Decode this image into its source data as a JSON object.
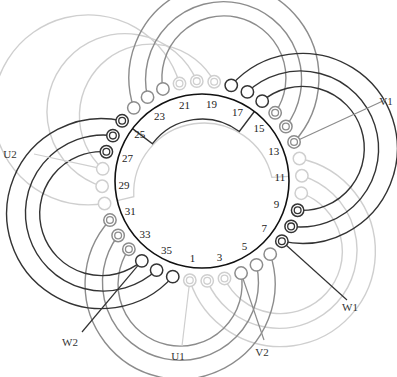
{
  "diagram": {
    "center": [
      202,
      181
    ],
    "stator_radius": 87,
    "label_radius": 78,
    "terminal_radius": 100,
    "slot_count": 36,
    "slot1_angle_deg": 97,
    "slot_step_deg": -10,
    "colors": {
      "dark": "#333333",
      "mid": "#8c8c8c",
      "light": "#cfcfcf",
      "stator": "#111111"
    },
    "slot_labels": [
      "1",
      "3",
      "5",
      "7",
      "9",
      "11",
      "13",
      "15",
      "17",
      "19",
      "21",
      "23",
      "25",
      "27",
      "29",
      "31",
      "33",
      "35"
    ],
    "groups": [
      {
        "name": "w-group-right",
        "color": "dark",
        "pairs": [
          [
            18,
            7
          ],
          [
            17,
            8
          ],
          [
            16,
            9
          ]
        ],
        "ring_a": "plain",
        "ring_b": "double",
        "radii": [
          95,
          78,
          62
        ]
      },
      {
        "name": "w-group-left",
        "color": "dark",
        "pairs": [
          [
            25,
            36
          ],
          [
            26,
            35
          ],
          [
            27,
            34
          ]
        ],
        "ring_a": "double",
        "ring_b": "plain",
        "radii": [
          95,
          78,
          62
        ]
      },
      {
        "name": "v-group-top",
        "color": "mid",
        "pairs": [
          [
            24,
            13
          ],
          [
            23,
            14
          ],
          [
            22,
            15
          ]
        ],
        "ring_a": "plain",
        "ring_b": "double",
        "radii": [
          95,
          78,
          62
        ]
      },
      {
        "name": "v-group-bottom",
        "color": "mid",
        "pairs": [
          [
            31,
            6
          ],
          [
            32,
            5
          ],
          [
            33,
            4
          ]
        ],
        "ring_a": "double",
        "ring_b": "plain",
        "radii": [
          95,
          78,
          62
        ]
      },
      {
        "name": "u-group-topleft",
        "color": "light",
        "pairs": [
          [
            21,
            30
          ],
          [
            20,
            29
          ],
          [
            19,
            28
          ]
        ],
        "ring_a": "double",
        "ring_b": "plain",
        "radii": [
          95,
          78,
          62
        ]
      },
      {
        "name": "u-group-bottomright",
        "color": "light",
        "pairs": [
          [
            1,
            12
          ],
          [
            2,
            11
          ],
          [
            3,
            10
          ]
        ],
        "ring_a": "double",
        "ring_b": "plain",
        "radii": [
          95,
          78,
          62
        ]
      }
    ],
    "leads": [
      {
        "label": "U1",
        "slot": 1,
        "color": "light",
        "text_pos": [
          178,
          360
        ],
        "line_end": [
          182,
          346
        ]
      },
      {
        "label": "V1",
        "slot": 13,
        "color": "mid",
        "text_pos": [
          386,
          105
        ],
        "line_end": [
          385,
          100
        ]
      },
      {
        "label": "W1",
        "slot": 7,
        "color": "dark",
        "text_pos": [
          350,
          311
        ],
        "line_end": [
          347,
          300
        ]
      },
      {
        "label": "U2",
        "slot": 28,
        "color": "light",
        "text_pos": [
          10,
          158
        ],
        "line_end": [
          34,
          154
        ]
      },
      {
        "label": "V2",
        "slot": 4,
        "color": "mid",
        "text_pos": [
          262,
          356
        ],
        "line_end": [
          264,
          340
        ]
      },
      {
        "label": "W2",
        "slot": 34,
        "color": "dark",
        "text_pos": [
          70,
          346
        ],
        "line_end": [
          82,
          332
        ]
      }
    ],
    "inner_coil": {
      "dark_from_slot": 25,
      "dark_to_slot": 16,
      "dark_inner_radius": 62,
      "light_from_slot": 30,
      "light_to_slot": 11,
      "light_inner_radius": 70
    }
  }
}
